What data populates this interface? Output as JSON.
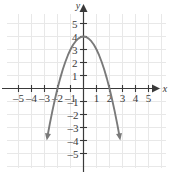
{
  "figure": {
    "name": "coordinate-plane-parabola",
    "background_color": "#ffffff",
    "grid_color": "#e8e8e8",
    "axis_color": "#3a3a3a",
    "curve_color": "#7a7a7a"
  },
  "axes": {
    "x_axis_label": "x",
    "y_axis_label": "y",
    "x_ticks": [
      {
        "value": -5,
        "label": "–5"
      },
      {
        "value": -4,
        "label": "–4"
      },
      {
        "value": -3,
        "label": "–3"
      },
      {
        "value": -2,
        "label": "–2"
      },
      {
        "value": -1,
        "label": "–1"
      },
      {
        "value": 1,
        "label": "1"
      },
      {
        "value": 2,
        "label": "2"
      },
      {
        "value": 3,
        "label": "3"
      },
      {
        "value": 4,
        "label": "4"
      },
      {
        "value": 5,
        "label": "5"
      }
    ],
    "y_ticks": [
      {
        "value": 5,
        "label": "5"
      },
      {
        "value": 4,
        "label": "4"
      },
      {
        "value": 3,
        "label": "3"
      },
      {
        "value": 2,
        "label": "2"
      },
      {
        "value": 1,
        "label": "1"
      },
      {
        "value": -1,
        "label": "–1"
      },
      {
        "value": -2,
        "label": "–2"
      },
      {
        "value": -3,
        "label": "–3"
      },
      {
        "value": -4,
        "label": "–4"
      },
      {
        "value": -5,
        "label": "–5"
      }
    ]
  },
  "chart_data": {
    "type": "line",
    "title": "",
    "subtitle": "",
    "xlabel": "x",
    "ylabel": "y",
    "xlim": [
      -5.8,
      5.8
    ],
    "ylim": [
      -5.8,
      5.8
    ],
    "grid": true,
    "grid_spacing": 1,
    "legend": null,
    "series": [
      {
        "name": "parabola",
        "equation": "y = 4 - x^2",
        "color": "#7a7a7a",
        "vertex": [
          0,
          4
        ],
        "x_intercepts": [
          -2,
          2
        ],
        "y_intercept": 4,
        "opens": "down",
        "arrow_ends": [
          "both"
        ],
        "x": [
          -2.78,
          -2.6,
          -2.4,
          -2.2,
          -2.0,
          -1.8,
          -1.6,
          -1.4,
          -1.2,
          -1.0,
          -0.8,
          -0.6,
          -0.4,
          -0.2,
          0.0,
          0.2,
          0.4,
          0.6,
          0.8,
          1.0,
          1.2,
          1.4,
          1.6,
          1.8,
          2.0,
          2.2,
          2.4,
          2.6,
          2.78
        ],
        "y": [
          -3.73,
          -2.76,
          -1.76,
          -0.84,
          0.0,
          0.76,
          1.44,
          2.04,
          2.56,
          3.0,
          3.36,
          3.64,
          3.84,
          3.96,
          4.0,
          3.96,
          3.84,
          3.64,
          3.36,
          3.0,
          2.56,
          2.04,
          1.44,
          0.76,
          0.0,
          -0.84,
          -1.76,
          -2.76,
          -3.73
        ]
      }
    ],
    "annotations": []
  }
}
